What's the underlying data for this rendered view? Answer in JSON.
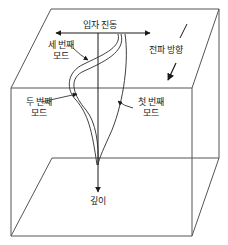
{
  "diagram": {
    "type": "3d-box-wave-modes",
    "colors": {
      "line": "#2a2a2a",
      "box_edge": "#555555",
      "text": "#222222",
      "background": "#ffffff"
    },
    "labels": {
      "particle_motion": "입자 진동",
      "propagation_direction": "전파 방향",
      "depth": "깊이",
      "third_mode_line1": "세 번째",
      "third_mode_line2": "모드",
      "second_mode_line1": "두 번째",
      "second_mode_line2": "모드",
      "first_mode_line1": "첫 번째",
      "first_mode_line2": "모드"
    },
    "modes": [
      {
        "name": "first",
        "label": "첫 번째 모드"
      },
      {
        "name": "second",
        "label": "두 번째 모드"
      },
      {
        "name": "third",
        "label": "세 번째 모드"
      }
    ]
  }
}
